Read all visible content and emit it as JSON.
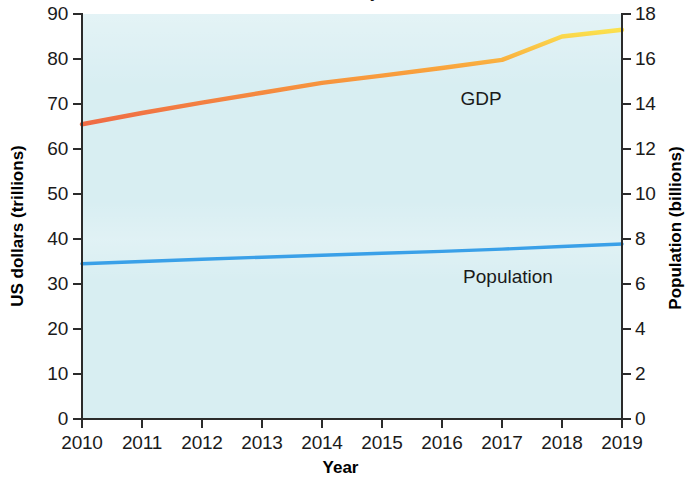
{
  "figure": {
    "title_fragment": "y",
    "background_color": "#ffffff",
    "plot_background_color": "#d8eef2"
  },
  "axes": {
    "x": {
      "title": "Year",
      "ticks": [
        "2010",
        "2011",
        "2012",
        "2013",
        "2014",
        "2015",
        "2016",
        "2017",
        "2018",
        "2019"
      ]
    },
    "y_left": {
      "title": "US dollars (trillions)",
      "ticks": [
        "0",
        "10",
        "20",
        "30",
        "40",
        "50",
        "60",
        "70",
        "80",
        "90"
      ]
    },
    "y_right": {
      "title": "Population (billions)",
      "ticks": [
        "0",
        "2",
        "4",
        "6",
        "8",
        "10",
        "12",
        "14",
        "16",
        "18"
      ]
    }
  },
  "series_labels": {
    "gdp": "GDP",
    "population": "Population"
  },
  "chart_data": {
    "type": "line",
    "title": "",
    "xlabel": "Year",
    "ylabel": "US dollars (trillions)",
    "y2label": "Population (billions)",
    "grid": false,
    "legend": "inline-labels",
    "x": [
      2010,
      2011,
      2012,
      2013,
      2014,
      2015,
      2016,
      2017,
      2018,
      2019
    ],
    "xlim": [
      2010,
      2019
    ],
    "ylim": [
      0,
      90
    ],
    "y2lim": [
      0,
      18
    ],
    "series": [
      {
        "name": "GDP",
        "axis": "left",
        "unit": "US dollars (trillions)",
        "color": "#f26d4a",
        "highlight_color": "#f9e04d",
        "values": [
          65.5,
          68.0,
          70.3,
          72.5,
          74.7,
          76.3,
          78.0,
          79.8,
          85.0,
          86.5
        ],
        "label_position": {
          "x": 2016.65,
          "y": 71.2
        }
      },
      {
        "name": "Population",
        "axis": "right",
        "unit": "billions",
        "color": "#3aa0e8",
        "values": [
          6.9,
          7.0,
          7.1,
          7.19,
          7.28,
          7.37,
          7.45,
          7.55,
          7.67,
          7.78
        ],
        "values_left_axis_equivalent": [
          34.5,
          35.0,
          35.5,
          35.9,
          36.4,
          36.8,
          37.3,
          37.7,
          38.3,
          38.9
        ],
        "label_position_x_year": 2017.1,
        "label_position_y_left_axis": 31.5
      }
    ]
  }
}
